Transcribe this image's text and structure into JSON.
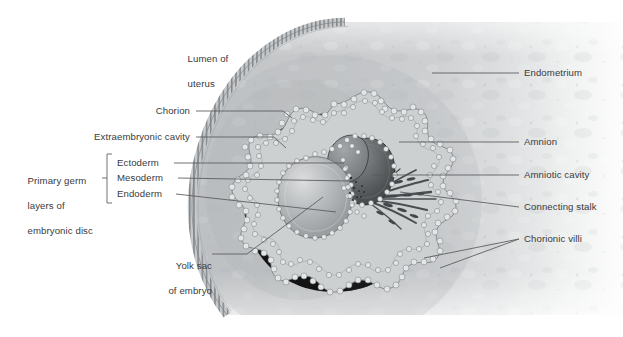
{
  "figure": {
    "type": "anatomical-illustration",
    "canvas": {
      "width": 623,
      "height": 337,
      "background": "#ffffff"
    },
    "palette": {
      "background": "#ffffff",
      "endometrium_light": "#e6e7e8",
      "endometrium_mid": "#c9cbcc",
      "endometrium_dark": "#b3b6b8",
      "epithelium_border": "#8e9295",
      "extraembryonic_cavity": "#151515",
      "extraembryonic_cavity_edge": "#3a3a3a",
      "chorion_beads": "#d8dadb",
      "chorion_bead_outline": "#7f8386",
      "yolk_sac": "#a9acae",
      "yolk_sac_highlight": "#d2d4d5",
      "amniotic_cavity": "#55585a",
      "connecting_stalk": "#5a5d5f",
      "leader_line": "#58595b",
      "label_text": "#3a3a3c"
    }
  },
  "labels": {
    "lumen_of_uterus": {
      "line1": "Lumen of",
      "line2": "uterus"
    },
    "chorion": "Chorion",
    "extraembryonic_cavity": "Extraembryonic cavity",
    "primary_germ_layers": {
      "line1": "Primary germ",
      "line2": "layers of",
      "line3": "embryonic disc"
    },
    "ectoderm": "Ectoderm",
    "mesoderm": "Mesoderm",
    "endoderm": "Endoderm",
    "yolk_sac": {
      "line1": "Yolk sac",
      "line2": "of embryo"
    },
    "endometrium": "Endometrium",
    "amnion": "Amnion",
    "amniotic_cavity": "Amniotic cavity",
    "connecting_stalk": "Connecting stalk",
    "chorionic_villi": "Chorionic villi"
  },
  "label_positions": {
    "lumen_of_uterus": {
      "x": 182,
      "y": 41,
      "align": "left"
    },
    "chorion": {
      "x": 190,
      "y": 111,
      "align": "right"
    },
    "extraembryonic_cavity": {
      "x": 190,
      "y": 137,
      "align": "right"
    },
    "primary_germ_layers": {
      "x": 22,
      "y": 163,
      "align": "left"
    },
    "ectoderm": {
      "x": 117,
      "y": 163,
      "align": "left"
    },
    "mesoderm": {
      "x": 117,
      "y": 178,
      "align": "left"
    },
    "endoderm": {
      "x": 117,
      "y": 194,
      "align": "left"
    },
    "yolk_sac": {
      "x": 207,
      "y": 254,
      "align": "right"
    },
    "endometrium": {
      "x": 524,
      "y": 73,
      "align": "left"
    },
    "amnion": {
      "x": 524,
      "y": 142,
      "align": "left"
    },
    "amniotic_cavity": {
      "x": 524,
      "y": 175,
      "align": "left"
    },
    "connecting_stalk": {
      "x": 524,
      "y": 207,
      "align": "left"
    },
    "chorionic_villi": {
      "x": 524,
      "y": 239,
      "align": "left"
    }
  }
}
